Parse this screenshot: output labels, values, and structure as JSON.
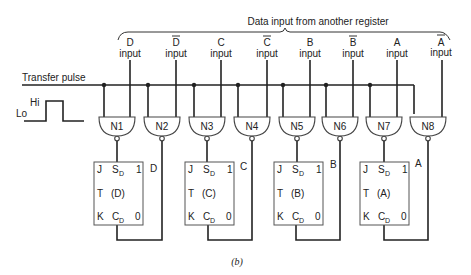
{
  "title": "Data input from another register",
  "transfer_label": "Transfer pulse",
  "pulse": {
    "hi": "Hi",
    "lo": "Lo"
  },
  "inputs": [
    {
      "name": "D",
      "bar": false,
      "label": "input"
    },
    {
      "name": "D",
      "bar": true,
      "label": "input"
    },
    {
      "name": "C",
      "bar": false,
      "label": "input"
    },
    {
      "name": "C",
      "bar": true,
      "label": "input"
    },
    {
      "name": "B",
      "bar": false,
      "label": "input"
    },
    {
      "name": "B",
      "bar": true,
      "label": "input"
    },
    {
      "name": "A",
      "bar": false,
      "label": "input"
    },
    {
      "name": "A",
      "bar": true,
      "label": "input"
    }
  ],
  "gates": [
    "N1",
    "N2",
    "N3",
    "N4",
    "N5",
    "N6",
    "N7",
    "N8"
  ],
  "flipflops": [
    {
      "j": "J",
      "sd": "S",
      "sd_sub": "D",
      "one": "1",
      "t": "T",
      "name": "(D)",
      "k": "K",
      "cd": "C",
      "cd_sub": "D",
      "zero": "0",
      "out": "D"
    },
    {
      "j": "J",
      "sd": "S",
      "sd_sub": "D",
      "one": "1",
      "t": "T",
      "name": "(C)",
      "k": "K",
      "cd": "C",
      "cd_sub": "D",
      "zero": "0",
      "out": "C"
    },
    {
      "j": "J",
      "sd": "S",
      "sd_sub": "D",
      "one": "1",
      "t": "T",
      "name": "(B)",
      "k": "K",
      "cd": "C",
      "cd_sub": "D",
      "zero": "0",
      "out": "B"
    },
    {
      "j": "J",
      "sd": "S",
      "sd_sub": "D",
      "one": "1",
      "t": "T",
      "name": "(A)",
      "k": "K",
      "cd": "C",
      "cd_sub": "D",
      "zero": "0",
      "out": "A"
    }
  ],
  "caption": "(b)"
}
